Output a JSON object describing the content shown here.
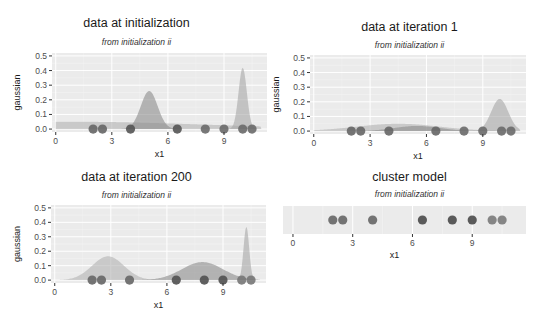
{
  "points_x": [
    2.0,
    2.5,
    4.0,
    6.5,
    8.0,
    9.0,
    10.0,
    10.5
  ],
  "chart_data": [
    {
      "type": "area",
      "title": "data at initialization",
      "subtitle": "from initialization ii",
      "xlabel": "x1",
      "ylabel": "gaussian",
      "xticks": [
        0,
        3,
        6,
        9
      ],
      "yticks": [
        "0.0",
        "0.1",
        "0.2",
        "0.3",
        "0.4",
        "0.5"
      ],
      "xlim": [
        -0.2,
        11.3
      ],
      "ylim": [
        -0.02,
        0.52
      ],
      "grid": true,
      "series": [
        {
          "name": "component 1",
          "type": "gaussian",
          "mean": 1.0,
          "sd": 7.0,
          "peak": 0.05
        },
        {
          "name": "component 2",
          "type": "gaussian",
          "mean": 5.0,
          "sd": 0.45,
          "peak": 0.26
        },
        {
          "name": "component 3",
          "type": "gaussian",
          "mean": 10.0,
          "sd": 0.22,
          "peak": 0.42
        }
      ],
      "points": [
        {
          "x": 2.0,
          "y": 0,
          "shade": "#666666"
        },
        {
          "x": 2.5,
          "y": 0,
          "shade": "#666666"
        },
        {
          "x": 4.0,
          "y": 0,
          "shade": "#555555"
        },
        {
          "x": 6.5,
          "y": 0,
          "shade": "#555555"
        },
        {
          "x": 8.0,
          "y": 0,
          "shade": "#6a6a6a"
        },
        {
          "x": 9.0,
          "y": 0,
          "shade": "#6a6a6a"
        },
        {
          "x": 10.0,
          "y": 0,
          "shade": "#6a6a6a"
        },
        {
          "x": 10.5,
          "y": 0,
          "shade": "#6a6a6a"
        }
      ]
    },
    {
      "type": "area",
      "title": "data at iteration 1",
      "subtitle": "from initialization ii",
      "xlabel": "x1",
      "ylabel": "gaussian",
      "xticks": [
        0,
        3,
        6,
        9
      ],
      "yticks": [
        "0.0",
        "0.1",
        "0.2",
        "0.3",
        "0.4",
        "0.5"
      ],
      "xlim": [
        -0.2,
        11.3
      ],
      "ylim": [
        -0.02,
        0.52
      ],
      "grid": true,
      "series": [
        {
          "name": "component 1",
          "type": "gaussian",
          "mean": 4.5,
          "sd": 2.2,
          "peak": 0.05
        },
        {
          "name": "component 2",
          "type": "gaussian",
          "mean": 5.5,
          "sd": 1.2,
          "peak": 0.035
        },
        {
          "name": "component 3",
          "type": "gaussian",
          "mean": 9.9,
          "sd": 0.45,
          "peak": 0.22
        }
      ],
      "points": [
        {
          "x": 2.0,
          "y": 0,
          "shade": "#666666"
        },
        {
          "x": 2.5,
          "y": 0,
          "shade": "#666666"
        },
        {
          "x": 4.0,
          "y": 0,
          "shade": "#666666"
        },
        {
          "x": 6.5,
          "y": 0,
          "shade": "#666666"
        },
        {
          "x": 8.0,
          "y": 0,
          "shade": "#6a6a6a"
        },
        {
          "x": 9.0,
          "y": 0,
          "shade": "#6a6a6a"
        },
        {
          "x": 10.0,
          "y": 0,
          "shade": "#6a6a6a"
        },
        {
          "x": 10.5,
          "y": 0,
          "shade": "#6a6a6a"
        }
      ]
    },
    {
      "type": "area",
      "title": "data at iteration 200",
      "subtitle": "from initialization ii",
      "xlabel": "x1",
      "ylabel": "gaussian",
      "xticks": [
        0,
        3,
        6,
        9
      ],
      "yticks": [
        "0.0",
        "0.1",
        "0.2",
        "0.3",
        "0.4",
        "0.5"
      ],
      "xlim": [
        -0.2,
        11.3
      ],
      "ylim": [
        -0.02,
        0.52
      ],
      "grid": true,
      "series": [
        {
          "name": "component 1",
          "type": "gaussian",
          "mean": 2.85,
          "sd": 0.85,
          "peak": 0.165
        },
        {
          "name": "component 2",
          "type": "gaussian",
          "mean": 7.9,
          "sd": 1.1,
          "peak": 0.125
        },
        {
          "name": "component 3",
          "type": "gaussian",
          "mean": 10.25,
          "sd": 0.15,
          "peak": 0.37
        }
      ],
      "points": [
        {
          "x": 2.0,
          "y": 0,
          "shade": "#666666"
        },
        {
          "x": 2.5,
          "y": 0,
          "shade": "#666666"
        },
        {
          "x": 4.0,
          "y": 0,
          "shade": "#666666"
        },
        {
          "x": 6.5,
          "y": 0,
          "shade": "#505050"
        },
        {
          "x": 8.0,
          "y": 0,
          "shade": "#505050"
        },
        {
          "x": 9.0,
          "y": 0,
          "shade": "#505050"
        },
        {
          "x": 10.0,
          "y": 0,
          "shade": "#777777"
        },
        {
          "x": 10.5,
          "y": 0,
          "shade": "#777777"
        }
      ]
    },
    {
      "type": "scatter",
      "title": "cluster model",
      "subtitle": "from initialization ii",
      "xlabel": "x1",
      "ylabel": "",
      "xticks": [
        0,
        3,
        6,
        9
      ],
      "yticks": [],
      "xlim": [
        -0.5,
        11.7
      ],
      "grid": true,
      "points": [
        {
          "x": 2.0,
          "cluster": 1,
          "shade": "#666666"
        },
        {
          "x": 2.5,
          "cluster": 1,
          "shade": "#666666"
        },
        {
          "x": 4.0,
          "cluster": 1,
          "shade": "#666666"
        },
        {
          "x": 6.5,
          "cluster": 2,
          "shade": "#4a4a4a"
        },
        {
          "x": 8.0,
          "cluster": 2,
          "shade": "#4a4a4a"
        },
        {
          "x": 9.0,
          "cluster": 2,
          "shade": "#4a4a4a"
        },
        {
          "x": 10.0,
          "cluster": 3,
          "shade": "#7a7a7a"
        },
        {
          "x": 10.5,
          "cluster": 3,
          "shade": "#7a7a7a"
        }
      ]
    }
  ],
  "colors": {
    "panel_bg": "#ebebeb",
    "grid_major": "#ffffff",
    "fill_1": "#b3b3b3",
    "fill_2": "#8c8c8c",
    "fill_3": "#a6a6a6"
  }
}
